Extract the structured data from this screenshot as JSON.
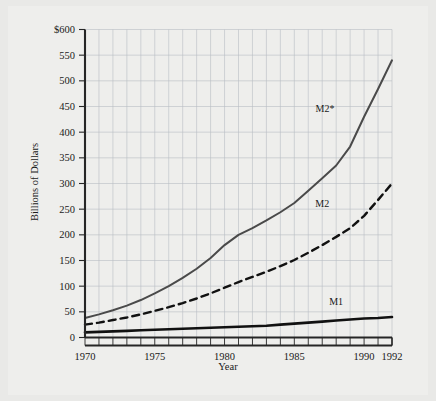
{
  "chart_data": {
    "type": "line",
    "title": "",
    "xlabel": "Year",
    "ylabel": "Billions of Dollars",
    "xlim": [
      1970,
      1992
    ],
    "ylim": [
      0,
      600
    ],
    "grid": true,
    "legend_position": "inline-annotations",
    "y_tick_labels": [
      "$600",
      "550",
      "500",
      "450",
      "400",
      "350",
      "300",
      "250",
      "200",
      "150",
      "100",
      "50",
      "0"
    ],
    "y_tick_values": [
      600,
      550,
      500,
      450,
      400,
      350,
      300,
      250,
      200,
      150,
      100,
      50,
      0
    ],
    "x_tick_labels": [
      "1970",
      "1975",
      "1980",
      "1985",
      "1990",
      "1992"
    ],
    "x_tick_values": [
      1970,
      1975,
      1980,
      1985,
      1990,
      1992
    ],
    "x": [
      1970,
      1971,
      1972,
      1973,
      1974,
      1975,
      1976,
      1977,
      1978,
      1979,
      1980,
      1981,
      1982,
      1983,
      1984,
      1985,
      1986,
      1987,
      1988,
      1989,
      1990,
      1991,
      1992
    ],
    "series": [
      {
        "name": "M2*",
        "label": "M2*",
        "style": "solid",
        "color": "#4a4a4a",
        "width": 2.0,
        "values": [
          38,
          45,
          53,
          62,
          73,
          86,
          100,
          116,
          134,
          155,
          180,
          200,
          213,
          228,
          244,
          262,
          286,
          310,
          335,
          372,
          430,
          484,
          540
        ]
      },
      {
        "name": "M2",
        "label": "M2",
        "style": "dashed",
        "color": "#111111",
        "width": 2.4,
        "values": [
          25,
          29,
          34,
          39,
          45,
          52,
          59,
          67,
          76,
          86,
          97,
          108,
          118,
          128,
          139,
          151,
          165,
          180,
          196,
          213,
          237,
          268,
          300
        ]
      },
      {
        "name": "M1",
        "label": "M1",
        "style": "solid",
        "color": "#111111",
        "width": 2.6,
        "values": [
          10,
          11,
          12,
          13,
          14,
          15,
          16,
          17,
          18,
          19,
          20,
          21,
          22,
          23,
          25,
          27,
          29,
          31,
          33,
          35,
          37,
          38,
          40
        ]
      }
    ],
    "annotations": [
      {
        "text": "M2*",
        "x": 1987.2,
        "y": 440
      },
      {
        "text": "M2",
        "x": 1987.0,
        "y": 255
      },
      {
        "text": "M1",
        "x": 1988.0,
        "y": 63
      }
    ]
  }
}
